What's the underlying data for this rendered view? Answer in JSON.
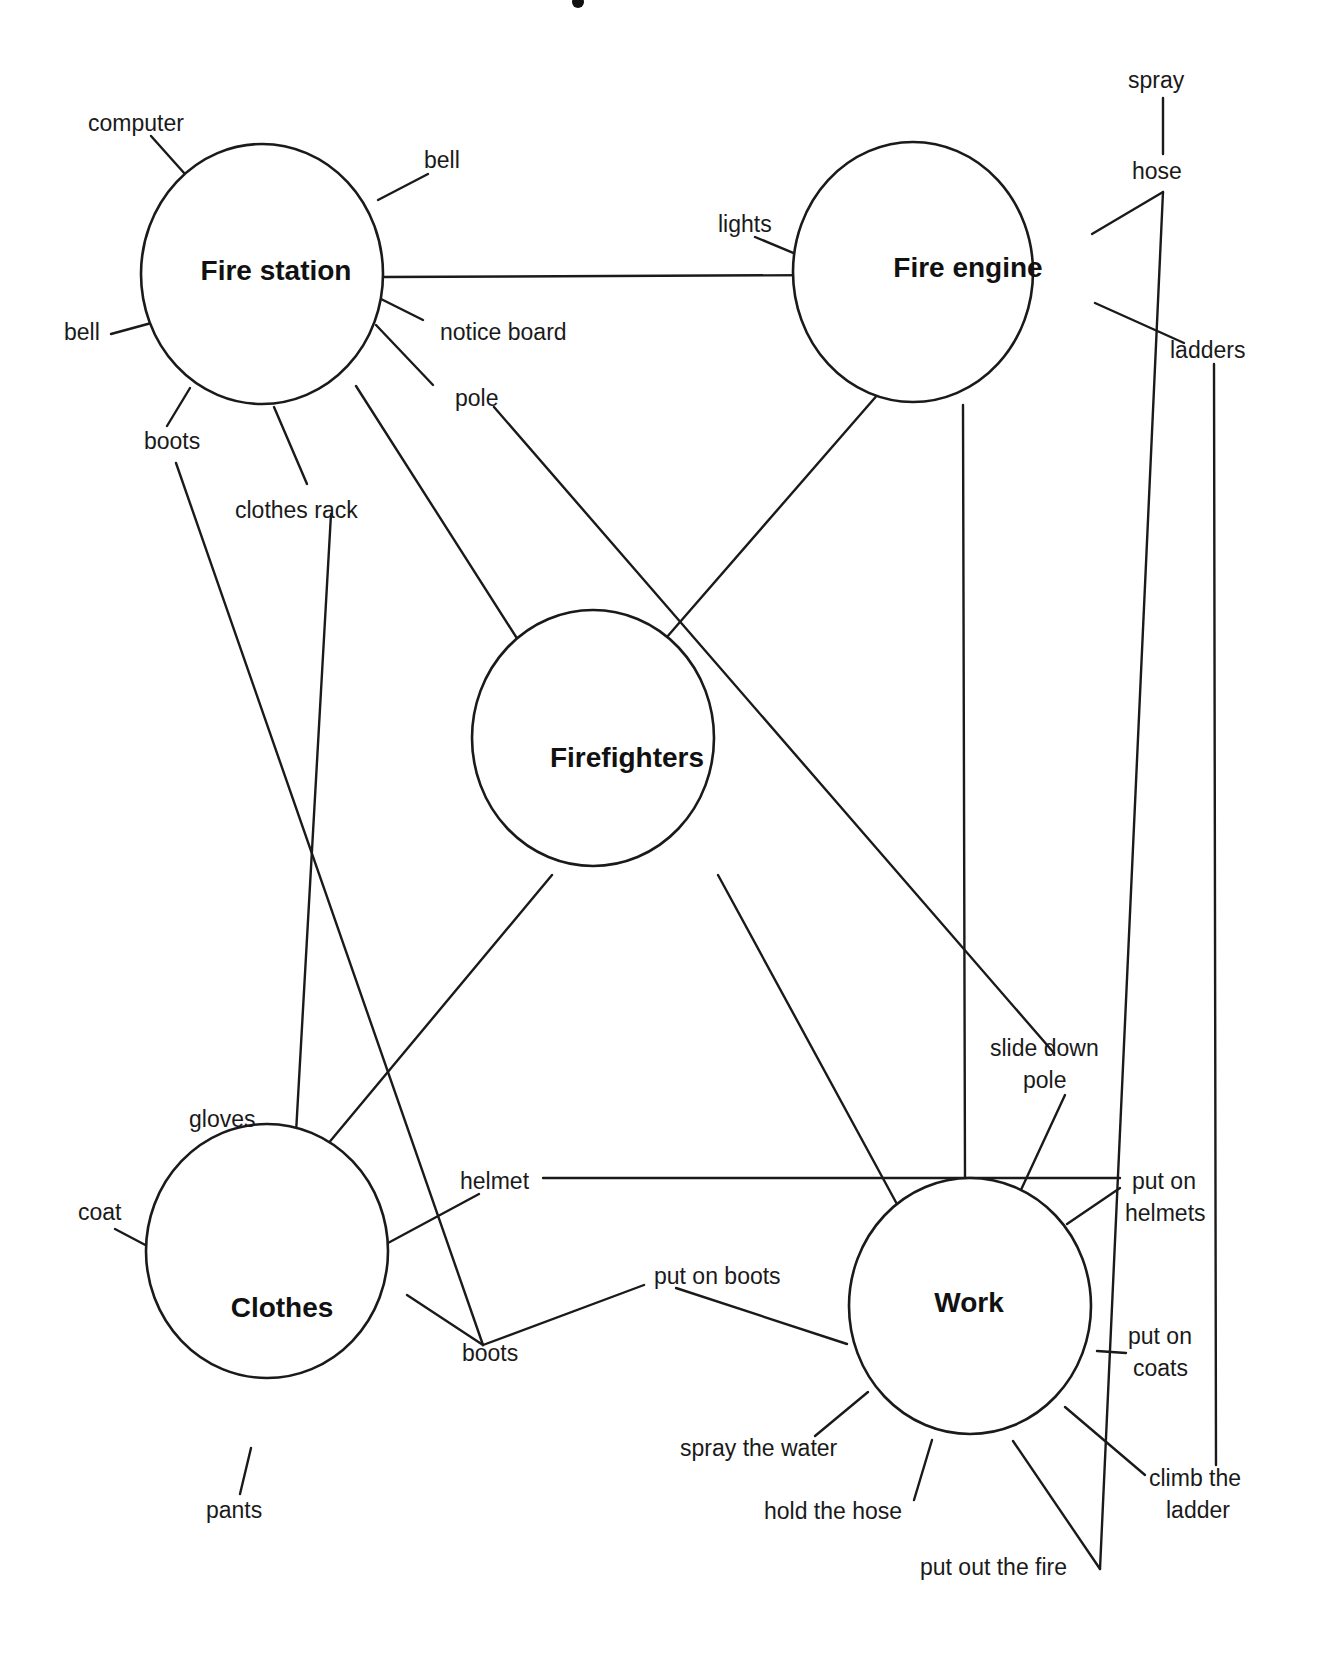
{
  "diagram": {
    "type": "mind-map",
    "style": {
      "line_color": "#1a1a1a",
      "background": "#ffffff"
    },
    "nodes": {
      "fire_station": {
        "label": "Fire station",
        "cx": 262,
        "cy": 274,
        "rx": 121,
        "ry": 130
      },
      "fire_engine": {
        "label": "Fire engine",
        "cx": 913,
        "cy": 272,
        "rx": 120,
        "ry": 130
      },
      "firefighters": {
        "label": "Firefighters",
        "cx": 593,
        "cy": 738,
        "rx": 121,
        "ry": 128
      },
      "clothes": {
        "label": "Clothes",
        "cx": 267,
        "cy": 1251,
        "rx": 121,
        "ry": 127
      },
      "work": {
        "label": "Work",
        "cx": 915,
        "cy": 1246,
        "rx": 121,
        "ry": 128
      }
    },
    "leaves": {
      "fs_computer": "computer",
      "fs_bell_top": "bell",
      "fs_bell_left": "bell",
      "fs_notice_board": "notice board",
      "fs_pole": "pole",
      "fs_boots": "boots",
      "fs_clothes_rack": "clothes rack",
      "fe_lights": "lights",
      "fe_hose": "hose",
      "fe_spray": "spray",
      "fe_ladders": "ladders",
      "cl_gloves": "gloves",
      "cl_coat": "coat",
      "cl_helmet": "helmet",
      "cl_boots": "boots",
      "cl_pants": "pants",
      "wk_slide_down_1": "slide down",
      "wk_slide_down_2": "pole",
      "wk_put_on_helmets_1": "put on",
      "wk_put_on_helmets_2": "helmets",
      "wk_put_on_boots": "put on boots",
      "wk_put_on_coats_1": "put on",
      "wk_put_on_coats_2": "coats",
      "wk_spray_water": "spray the water",
      "wk_hold_hose": "hold the hose",
      "wk_put_out_fire": "put out the fire",
      "wk_climb_ladder_1": "climb the",
      "wk_climb_ladder_2": "ladder"
    },
    "connections": [
      [
        "Fire station",
        "Fire engine"
      ],
      [
        "Fire station",
        "Firefighters"
      ],
      [
        "Fire engine",
        "Firefighters"
      ],
      [
        "Fire engine",
        "Work"
      ],
      [
        "Firefighters",
        "Clothes"
      ],
      [
        "Firefighters",
        "Work"
      ],
      [
        "boots (Fire station)",
        "boots (Clothes)"
      ],
      [
        "clothes rack",
        "Clothes"
      ],
      [
        "pole",
        "slide down pole"
      ],
      [
        "hose",
        "put out the fire"
      ],
      [
        "ladders",
        "climb the ladder"
      ],
      [
        "helmet",
        "put on helmets"
      ],
      [
        "boots (Clothes)",
        "put on boots"
      ]
    ]
  }
}
